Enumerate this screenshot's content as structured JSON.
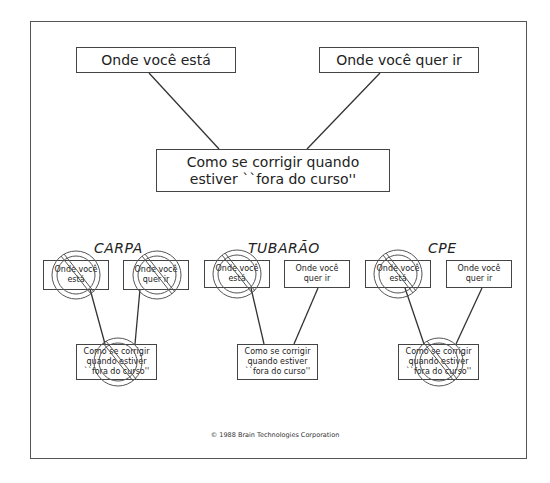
{
  "diagram": {
    "top": {
      "current_state": "Onde você está",
      "goal": "Onde você quer ir",
      "correction_line1": "Como se corrigir quando",
      "correction_line2": "estiver ``fora do curso''"
    },
    "groups": [
      {
        "title": "CARPA",
        "current_line1": "Onde você",
        "current_line2": "está",
        "goal_line1": "Onde você",
        "goal_line2": "quer ir",
        "corr_line1": "Como se corrigir",
        "corr_line2": "quando estiver",
        "corr_line3": "``fora do curso''",
        "crossed_out": [
          "current",
          "goal",
          "correction"
        ]
      },
      {
        "title": "TUBARÃO",
        "current_line1": "Onde você",
        "current_line2": "está",
        "goal_line1": "Onde você",
        "goal_line2": "quer ir",
        "corr_line1": "Como se corrigir",
        "corr_line2": "quando estiver",
        "corr_line3": "``fora do curso''",
        "crossed_out": [
          "current"
        ]
      },
      {
        "title": "CPE",
        "current_line1": "Onde você",
        "current_line2": "está",
        "goal_line1": "Onde você",
        "goal_line2": "quer ir",
        "corr_line1": "Como se corrigir",
        "corr_line2": "quando estiver",
        "corr_line3": "``fora do curso''",
        "crossed_out": [
          "current",
          "correction"
        ]
      }
    ],
    "copyright": "© 1988 Brain Technologies Corporation",
    "colors": {
      "line": "#444444",
      "symbol": "#555555",
      "background": "#ffffff"
    }
  }
}
